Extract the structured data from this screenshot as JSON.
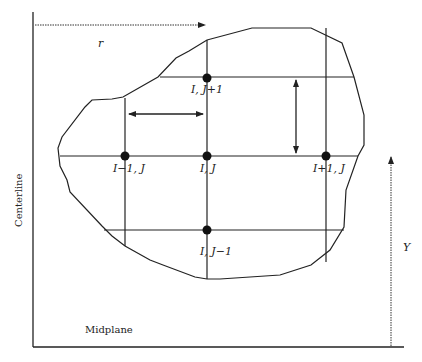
{
  "diagram": {
    "type": "finite-difference-grid",
    "axes": {
      "centerline_label": "Centerline",
      "midplane_label": "Midplane",
      "r_label": "r",
      "y_label": "Y"
    },
    "nodes": [
      {
        "id": "top",
        "label": "I, J+1"
      },
      {
        "id": "left",
        "label": "I−1, J"
      },
      {
        "id": "center",
        "label": "I, J"
      },
      {
        "id": "right",
        "label": "I+1, J"
      },
      {
        "id": "bottom",
        "label": "I, J−1"
      }
    ],
    "colors": {
      "line": "#222222",
      "node": "#111111",
      "background": "#ffffff"
    }
  }
}
